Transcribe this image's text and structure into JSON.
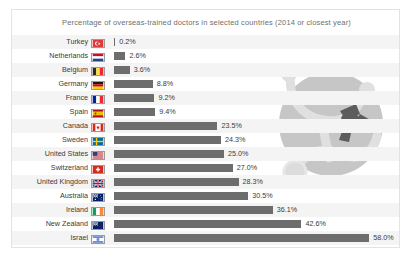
{
  "chart_data": {
    "type": "bar",
    "orientation": "horizontal",
    "title": "Percentage of overseas-trained doctors in selected countries (2014 or closest year)",
    "xlabel": "",
    "ylabel": "",
    "xlim": [
      0,
      60
    ],
    "grid": false,
    "legend": false,
    "value_suffix": "%",
    "categories": [
      "Turkey",
      "Netherlands",
      "Belgium",
      "Germany",
      "France",
      "Spain",
      "Canada",
      "Sweden",
      "United States",
      "Switzerland",
      "United Kingdom",
      "Australia",
      "Ireland",
      "New Zealand",
      "Israel"
    ],
    "values": [
      0.2,
      2.6,
      3.6,
      8.8,
      9.2,
      9.4,
      23.5,
      24.3,
      25.0,
      27.0,
      28.3,
      30.5,
      36.1,
      42.6,
      58.0
    ],
    "value_labels": [
      "0.2%",
      "2.6%",
      "3.6%",
      "8.8%",
      "9.2%",
      "9.4%",
      "23.5%",
      "24.3%",
      "25.0%",
      "27.0%",
      "28.3%",
      "30.5%",
      "36.1%",
      "42.6%",
      "58.0%"
    ],
    "flags": [
      "flag-turkey",
      "flag-netherlands",
      "flag-belgium",
      "flag-germany",
      "flag-france",
      "flag-spain",
      "flag-canada",
      "flag-sweden",
      "flag-united-states",
      "flag-switzerland",
      "flag-united-kingdom",
      "flag-australia",
      "flag-ireland",
      "flag-new-zealand",
      "flag-israel"
    ]
  },
  "colors": {
    "bar": "#6d6d6d",
    "stripe": "#f4f4f4",
    "card_background": "#ffffff",
    "card_border": "#e3e3e3",
    "title_text": "#6f6f6f",
    "label_text": "#3a3a3a",
    "watermark_circle": "#c6c6c6",
    "watermark_tube": "#e0e0e0",
    "watermark_connector": "#5c5c5c"
  },
  "watermark": {
    "name": "stethoscope-watermark"
  }
}
